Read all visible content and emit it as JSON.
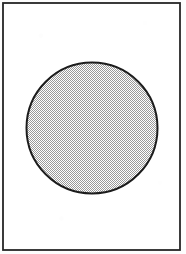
{
  "figure": {
    "caption": "",
    "background_color": "#fdfdfd",
    "ink_color": "#1a1a1a"
  },
  "frame": {
    "name": "rectangular-border",
    "shape": "rectangle",
    "stroke_color": "#262626",
    "stroke_width_px": 2,
    "fill_color": "#ffffff",
    "x_px": 3,
    "y_px": 3,
    "width_px": 177,
    "height_px": 247
  },
  "shape": {
    "name": "filled-circle",
    "shape": "circle",
    "center_x_px": 92,
    "center_y_px": 128,
    "radius_px": 66,
    "diameter_px": 132,
    "stroke_color": "#1c1c1c",
    "stroke_width_px": 2,
    "fill_style": "stipple-checkerboard-dither",
    "fill_color": "#d2d2d2",
    "fill_tone_percent": 50,
    "fill_pattern_pitch_px": 2
  }
}
